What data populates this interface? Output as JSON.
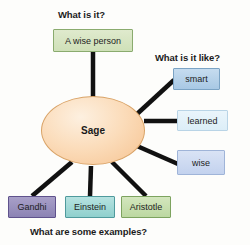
{
  "diagram": {
    "title_center": "Sage",
    "labels": {
      "what_is_it": "What is it?",
      "what_is_it_like": "What is it like?",
      "examples": "What are some examples?"
    },
    "definition": {
      "text": "A wise person",
      "color": "#cfe0b8"
    },
    "attributes": [
      {
        "text": "smart",
        "color": "#a8c8e4"
      },
      {
        "text": "learned",
        "color": "#dceef8"
      },
      {
        "text": "wise",
        "color": "#c3d2ee"
      }
    ],
    "examples": [
      {
        "text": "Gandhi",
        "color": "#8c83b4"
      },
      {
        "text": "Einstein",
        "color": "#8fd0cd"
      },
      {
        "text": "Aristotle",
        "color": "#bcd8a1"
      }
    ],
    "center": {
      "text": "Sage",
      "color": "#fbdcba"
    },
    "edge_color": "#111111",
    "background": "#fdfdfb"
  }
}
